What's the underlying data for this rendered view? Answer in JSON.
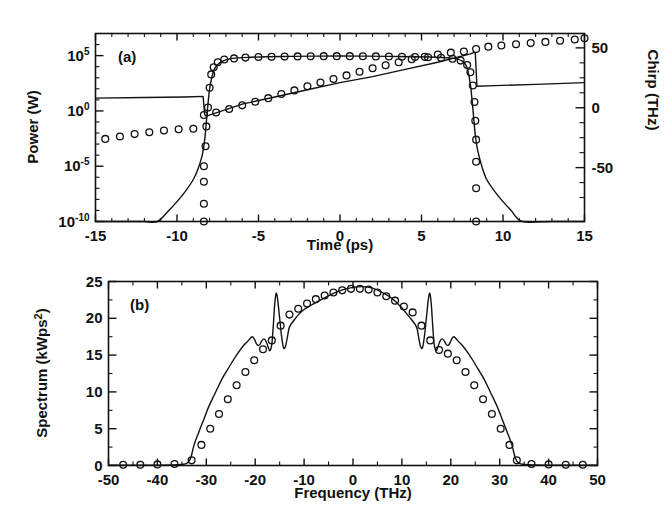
{
  "figure": {
    "title": "",
    "background": "#ffffff",
    "ink": "#111111",
    "width": 672,
    "height": 532
  },
  "panels": [
    {
      "tag": "(a)",
      "xlabel": "Time (ps)",
      "ylabel_left": "Power (W)",
      "ylabel_right": "Chirp (THz)",
      "xticks": [
        "-15",
        "-10",
        "-5",
        "0",
        "5",
        "10",
        "15"
      ],
      "yticks_left": [
        "10",
        "10",
        "10",
        "10"
      ],
      "yticks_left_exp": [
        "5",
        "0",
        "-5",
        "-10"
      ],
      "yticks_right": [
        "50",
        "0",
        "-50"
      ]
    },
    {
      "tag": "(b)",
      "xlabel": "Frequency (THz)",
      "ylabel": "Spectrum (kWps",
      "ylabel_exp": "2",
      "ylabel_tail": ")",
      "xticks": [
        "-50",
        "-40",
        "-30",
        "-20",
        "-10",
        "0",
        "10",
        "20",
        "30",
        "40",
        "50"
      ],
      "yticks": [
        "0",
        "5",
        "10",
        "15",
        "20",
        "25"
      ]
    }
  ],
  "chart_data": [
    {
      "type": "line",
      "id": "panel-a",
      "title": "(a)",
      "xlabel": "Time (ps)",
      "ylabel": "Power (W)",
      "ylabel_secondary": "Chirp (THz)",
      "xlim": [
        -15,
        15
      ],
      "ylim_power_log10": [
        -10,
        7
      ],
      "ylim_chirp": [
        -95,
        62
      ],
      "yscale": "log",
      "grid": false,
      "legend": "none",
      "xticks": [
        -15,
        -10,
        -5,
        0,
        5,
        10,
        15
      ],
      "yticks_power": [
        100000.0,
        1.0,
        1e-05,
        1e-10
      ],
      "yticks_chirp": [
        50,
        0,
        -50
      ],
      "series": [
        {
          "name": "power-line",
          "style": "solid-line",
          "axis": "left",
          "comment": "super-Gaussian pulse, log power vs time (log10 values)",
          "x": [
            -15,
            -13,
            -12,
            -11.2,
            -10.5,
            -10,
            -9.5,
            -9,
            -8.7,
            -8.45,
            -8.3,
            -8.2,
            -8.1,
            -8.0,
            -7.85,
            -7.7,
            -7.5,
            -7.2,
            -6.8,
            -6.2,
            -5.5,
            -4.5,
            -3.0,
            -1.5,
            0,
            1.5,
            3.0,
            4.5,
            5.5,
            6.2,
            6.8,
            7.2,
            7.5,
            7.7,
            7.85,
            8.0,
            8.1,
            8.2,
            8.3,
            8.45,
            8.7,
            9.0,
            9.5,
            10.0,
            10.5,
            11.2,
            13,
            15
          ],
          "y_log10": [
            -10,
            -10,
            -10,
            -10,
            -9.0,
            -8.2,
            -7.3,
            -6.2,
            -5.2,
            -4.0,
            -2.6,
            -1.0,
            0.6,
            2.0,
            3.1,
            3.8,
            4.2,
            4.5,
            4.7,
            4.8,
            4.85,
            4.9,
            4.93,
            4.95,
            4.96,
            4.95,
            4.93,
            4.9,
            4.87,
            4.83,
            4.77,
            4.68,
            4.5,
            4.2,
            3.6,
            2.4,
            1.0,
            -0.6,
            -2.2,
            -3.6,
            -5.0,
            -6.2,
            -7.3,
            -8.2,
            -9.0,
            -10,
            -10,
            -10
          ]
        },
        {
          "name": "power-markers",
          "style": "open-circles",
          "axis": "left",
          "x": [
            -8.35,
            -8.35,
            -8.35,
            -8.35,
            -8.25,
            -8.2,
            -8.1,
            -8.0,
            -7.9,
            -7.75,
            -7.5,
            -7.1,
            -6.5,
            -5.8,
            -5.0,
            -4.2,
            -3.4,
            -2.6,
            -1.8,
            -1.0,
            -0.2,
            0.6,
            1.4,
            2.2,
            3.0,
            3.8,
            4.6,
            5.4,
            6.2,
            6.9,
            7.4,
            7.8,
            8.0,
            8.15,
            8.25,
            8.3,
            8.35,
            8.35,
            8.35,
            8.35
          ],
          "y_log10": [
            -10,
            -8.4,
            -6.4,
            -5.0,
            -3.2,
            -1.4,
            0.3,
            2.1,
            3.3,
            3.95,
            4.4,
            4.65,
            4.75,
            4.82,
            4.87,
            4.89,
            4.91,
            4.93,
            4.94,
            4.95,
            4.95,
            4.95,
            4.94,
            4.93,
            4.92,
            4.9,
            4.88,
            4.85,
            4.8,
            4.72,
            4.55,
            4.15,
            3.5,
            2.3,
            0.8,
            -0.9,
            -2.6,
            -4.6,
            -7.0,
            -10
          ]
        },
        {
          "name": "chirp-line",
          "style": "solid-line",
          "axis": "right",
          "comment": "chirp with sharp steps at pulse edges",
          "x": [
            -15,
            -12,
            -9.5,
            -8.4,
            -8.3,
            -8.2,
            -6,
            -4,
            -2,
            0,
            2,
            4,
            6,
            8.0,
            8.2,
            8.3,
            8.4,
            9.5,
            12,
            15
          ],
          "y": [
            8,
            8.5,
            9,
            9.5,
            -6,
            -7,
            3,
            9,
            15,
            21,
            26,
            32,
            38,
            45,
            46,
            46,
            18,
            18.5,
            19.5,
            21
          ]
        },
        {
          "name": "chirp-markers",
          "style": "open-circles",
          "axis": "right",
          "x": [
            -14.4,
            -13.5,
            -12.6,
            -11.7,
            -10.8,
            -9.9,
            -9.0,
            -8.35,
            -7.6,
            -6.8,
            -6.0,
            -5.2,
            -4.4,
            -3.6,
            -2.8,
            -2.0,
            -1.2,
            -0.4,
            0.4,
            1.2,
            2.0,
            2.8,
            3.6,
            4.4,
            5.2,
            6.0,
            6.8,
            7.6,
            8.35,
            9.1,
            9.9,
            10.8,
            11.7,
            12.6,
            13.5,
            14.4,
            15.0
          ],
          "y": [
            -26,
            -24,
            -22,
            -20.5,
            -19,
            -18,
            -17.5,
            -6,
            -4,
            -1,
            2,
            5,
            8,
            11.5,
            14.5,
            18,
            21,
            24,
            27,
            30,
            33,
            35.5,
            38,
            40.5,
            42.5,
            44.5,
            46,
            47,
            49,
            51,
            52,
            53,
            54,
            55,
            56,
            57,
            58
          ]
        }
      ]
    },
    {
      "type": "line",
      "id": "panel-b",
      "title": "(b)",
      "xlabel": "Frequency (THz)",
      "ylabel": "Spectrum (kWps^2)",
      "xlim": [
        -50,
        50
      ],
      "ylim": [
        0,
        25
      ],
      "grid": false,
      "legend": "none",
      "xticks": [
        -50,
        -40,
        -30,
        -20,
        -10,
        0,
        10,
        20,
        30,
        40,
        50
      ],
      "yticks": [
        0,
        5,
        10,
        15,
        20,
        25
      ],
      "series": [
        {
          "name": "spectrum-line",
          "style": "solid-line",
          "x": [
            -50,
            -40,
            -36,
            -34,
            -33.2,
            -32.5,
            -31.5,
            -30.5,
            -29.5,
            -28.5,
            -27.5,
            -26.5,
            -25.5,
            -24.5,
            -23.5,
            -22.5,
            -21.5,
            -21.0,
            -20.6,
            -20.2,
            -19.8,
            -19.4,
            -19.0,
            -18.6,
            -18.2,
            -17.8,
            -17.4,
            -17.0,
            -16.6,
            -16.3,
            -16.0,
            -15.7,
            -15.4,
            -15.0,
            -14.6,
            -14.2,
            -13.8,
            -13.4,
            -13.0,
            -12.0,
            -11.0,
            -10.0,
            -8.0,
            -6.0,
            -4.0,
            -2.0,
            0,
            2.0,
            4.0,
            6.0,
            8.0,
            10.0,
            11.0,
            12.0,
            13.0,
            13.4,
            13.8,
            14.2,
            14.6,
            15.0,
            15.4,
            15.7,
            16.0,
            16.3,
            16.6,
            17.0,
            17.4,
            17.8,
            18.2,
            18.6,
            19.0,
            19.4,
            19.8,
            20.2,
            20.6,
            21.0,
            21.5,
            22.5,
            23.5,
            24.5,
            25.5,
            26.5,
            27.5,
            28.5,
            29.5,
            30.5,
            31.5,
            32.5,
            33.2,
            34,
            36,
            40,
            50
          ],
          "y": [
            0.05,
            0.05,
            0.1,
            0.3,
            1.0,
            2.8,
            4.6,
            6.3,
            8.0,
            9.4,
            10.8,
            12.1,
            13.2,
            14.3,
            15.3,
            16.2,
            16.9,
            17.3,
            17.5,
            17.2,
            16.6,
            16.3,
            16.5,
            17.0,
            17.2,
            16.9,
            16.2,
            15.6,
            16.5,
            19.0,
            22.0,
            23.4,
            22.5,
            20.0,
            17.5,
            16.0,
            16.2,
            17.5,
            18.8,
            19.8,
            20.6,
            21.2,
            22.0,
            22.7,
            23.4,
            23.9,
            24.2,
            24.3,
            24.1,
            23.5,
            22.7,
            21.4,
            20.6,
            19.8,
            18.8,
            17.5,
            16.2,
            16.0,
            17.5,
            20.0,
            22.5,
            23.4,
            22.0,
            19.0,
            16.5,
            15.6,
            16.2,
            16.9,
            17.2,
            17.0,
            16.5,
            16.3,
            16.6,
            17.2,
            17.5,
            17.3,
            16.9,
            16.2,
            15.3,
            14.3,
            13.2,
            12.1,
            10.8,
            9.4,
            8.0,
            6.3,
            4.6,
            2.8,
            1.0,
            0.3,
            0.1,
            0.05,
            0.05
          ]
        },
        {
          "name": "spectrum-markers",
          "style": "open-circles",
          "x": [
            -47,
            -43.5,
            -40,
            -36.5,
            -33,
            -31,
            -29.2,
            -27.4,
            -25.6,
            -23.8,
            -22,
            -20.2,
            -18.4,
            -16.6,
            -14.8,
            -13,
            -11.2,
            -9.4,
            -7.6,
            -5.8,
            -4.0,
            -2.2,
            -0.4,
            1.4,
            3.2,
            5.0,
            6.8,
            8.6,
            10.4,
            12.2,
            14.0,
            15.8,
            17.6,
            19.4,
            21.2,
            23.0,
            24.8,
            26.6,
            28.4,
            30.2,
            32.0,
            33.5,
            36.5,
            40,
            43.5,
            47
          ],
          "y": [
            0.1,
            0.1,
            0.15,
            0.2,
            0.7,
            2.8,
            5.0,
            7.0,
            9.0,
            10.9,
            12.7,
            14.3,
            15.8,
            17.0,
            19.0,
            20.5,
            21.3,
            22.0,
            22.6,
            23.1,
            23.5,
            23.8,
            24.0,
            24.0,
            23.9,
            23.5,
            23.0,
            22.4,
            21.6,
            20.8,
            19.0,
            17.0,
            15.7,
            15.2,
            14.3,
            12.7,
            10.9,
            9.0,
            7.0,
            5.0,
            2.8,
            0.7,
            0.2,
            0.15,
            0.1,
            0.1
          ]
        }
      ]
    }
  ]
}
